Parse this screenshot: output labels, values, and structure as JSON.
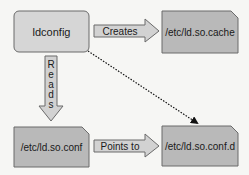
{
  "nodes": {
    "ldconfig": {
      "label": "ldconfig"
    },
    "cache": {
      "label": "/etc/ld.so.cache"
    },
    "conf": {
      "label": "/etc/ld.so.conf"
    },
    "confd": {
      "label": "/etc/ld.so.conf.d"
    }
  },
  "edges": {
    "creates": {
      "label": "Creates",
      "from": "ldconfig",
      "to": "cache"
    },
    "reads": {
      "label": "Reads",
      "letters": [
        "R",
        "e",
        "a",
        "d",
        "s"
      ],
      "from": "ldconfig",
      "to": "conf"
    },
    "points_to": {
      "label": "Points to",
      "from": "conf",
      "to": "confd"
    },
    "dotted": {
      "from": "ldconfig",
      "to": "confd",
      "style": "dotted"
    }
  },
  "colors": {
    "background": "#f6f6f4",
    "process_fill": "#d6d6d6",
    "file_fill": "#b9b9b9",
    "arrow_fill": "#d2d2d2",
    "stroke": "#6a6a6a",
    "text": "#1a1a1a"
  }
}
